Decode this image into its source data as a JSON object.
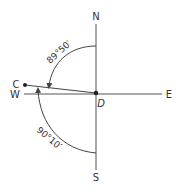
{
  "diagram": {
    "type": "compass bearing diagram",
    "labels": {
      "north": "N",
      "south": "S",
      "east": "E",
      "west": "W",
      "point_c": "C",
      "point_d": "D"
    },
    "angles": {
      "upper": "89°50′",
      "lower": "90°10′"
    },
    "colors": {
      "line": "#444444",
      "text": "#333333",
      "background": "#ffffff"
    }
  }
}
